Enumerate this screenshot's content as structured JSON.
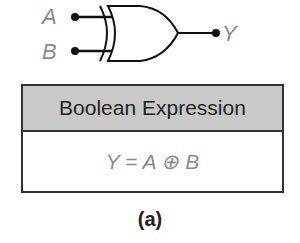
{
  "gate": {
    "type": "XOR",
    "inputs": [
      "A",
      "B"
    ],
    "output": "Y"
  },
  "table": {
    "header": "Boolean Expression",
    "expression": "Y = A ⊕ B"
  },
  "caption": "(a)"
}
